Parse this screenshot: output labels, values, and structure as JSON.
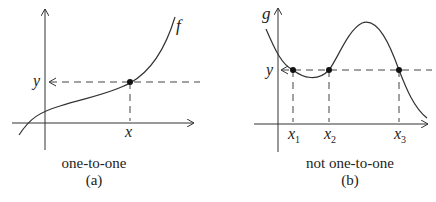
{
  "figure": {
    "panel_a": {
      "function_label": "f",
      "y_label": "y",
      "x_label": "x",
      "caption": "one-to-one",
      "tag": "(a)"
    },
    "panel_b": {
      "function_label": "g",
      "y_label": "y",
      "x_labels": [
        "x",
        "x",
        "x"
      ],
      "x_subscripts": [
        "1",
        "2",
        "3"
      ],
      "caption": "not one-to-one",
      "tag": "(b)"
    },
    "colors": {
      "line": "#222222",
      "dash": "#444444"
    }
  }
}
